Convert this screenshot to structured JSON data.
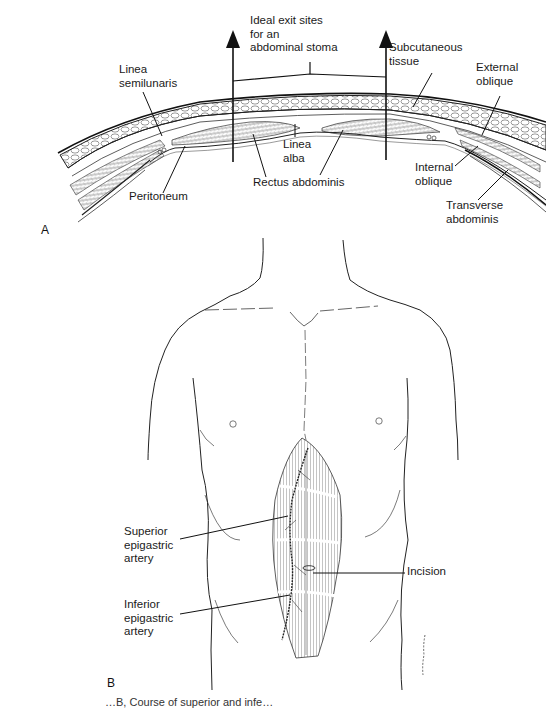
{
  "figure": {
    "panel_a": {
      "letter": "A",
      "labels": {
        "exit_sites": "Ideal exit sites\nfor an\nabdominal  stoma",
        "linea_semilunaris": "Linea\nsemilunaris",
        "subcutaneous_tissue": "Subcutaneous\ntissue",
        "external_oblique": "External\noblique",
        "linea_alba": "Linea\nalba",
        "peritoneum": "Peritoneum",
        "rectus_abdominis": "Rectus abdominis",
        "internal_oblique": "Internal\noblique",
        "transverse_abdominis": "Transverse\nabdominis"
      }
    },
    "panel_b": {
      "letter": "B",
      "labels": {
        "superior_epigastric_artery": "Superior\nepigastric\nartery",
        "inferior_epigastric_artery": "Inferior\nepigastric\nartery",
        "incision": "Incision"
      }
    },
    "caption_partial": "…B, Course of superior and infe…"
  }
}
